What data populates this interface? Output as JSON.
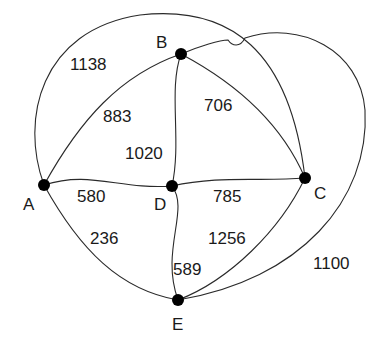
{
  "diagram": {
    "type": "weighted-graph",
    "nodes": [
      {
        "id": "A",
        "label": "A"
      },
      {
        "id": "B",
        "label": "B"
      },
      {
        "id": "C",
        "label": "C"
      },
      {
        "id": "D",
        "label": "D"
      },
      {
        "id": "E",
        "label": "E"
      }
    ],
    "edges": [
      {
        "from": "A",
        "to": "C",
        "weight": "1138"
      },
      {
        "from": "A",
        "to": "B",
        "weight": "883"
      },
      {
        "from": "B",
        "to": "D",
        "weight": "1020"
      },
      {
        "from": "B",
        "to": "C",
        "weight": "706"
      },
      {
        "from": "A",
        "to": "D",
        "weight": "580"
      },
      {
        "from": "D",
        "to": "C",
        "weight": "785"
      },
      {
        "from": "A",
        "to": "E",
        "weight": "236"
      },
      {
        "from": "D",
        "to": "E",
        "weight": "589"
      },
      {
        "from": "C",
        "to": "E",
        "weight": "1256"
      },
      {
        "from": "B",
        "to": "E",
        "weight": "1100"
      }
    ],
    "colors": {
      "edge": "#2a2a2a",
      "node": "#000000",
      "text": "#1a1a1a",
      "background": "#ffffff"
    }
  }
}
